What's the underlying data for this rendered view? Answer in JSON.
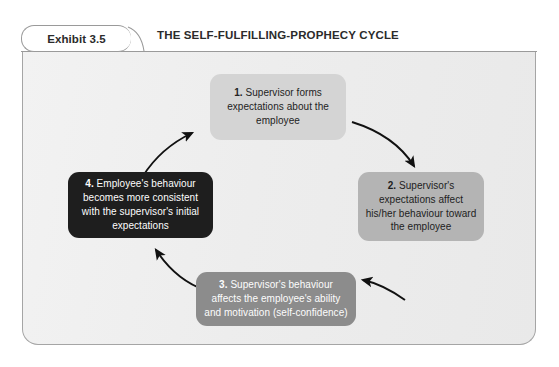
{
  "exhibit": {
    "tab_label": "Exhibit 3.5",
    "title": "THE SELF-FULFILLING-PROPHECY CYCLE"
  },
  "colors": {
    "box_1_bg": "#d4d4d4",
    "box_2_bg": "#b4b4b4",
    "box_3_bg": "#8c8c8c",
    "box_4_bg": "#1e1e1e",
    "panel_bg": "#ededed",
    "panel_border": "#a5a5a5",
    "arrow": "#111111",
    "text_dark": "#232323",
    "text_light": "#fdfdfd"
  },
  "diagram": {
    "type": "cycle",
    "step_count": 4,
    "steps": [
      {
        "number": "1.",
        "text": "Supervisor forms expectations about the employee",
        "full": "1.  Supervisor forms expectations about the employee",
        "position": "top"
      },
      {
        "number": "2.",
        "text": "Supervisor's expectations affect his/her behaviour toward the employee",
        "full": "2.  Supervisor's expectations affect his/her behaviour toward the employee",
        "position": "right"
      },
      {
        "number": "3.",
        "text": "Supervisor's behaviour affects the employee's ability and motivation (self-confidence)",
        "full": "3.  Supervisor's behaviour affects the employee's ability and motivation (self-confidence)",
        "position": "bottom"
      },
      {
        "number": "4.",
        "text": "Employee's behaviour becomes more consistent with the supervisor's initial expectations",
        "full": "4.  Employee's behaviour becomes more consistent with the supervisor's initial expectations",
        "position": "left"
      }
    ],
    "arrows": [
      {
        "name": "arrow-1-to-2",
        "from": "1",
        "to": "2",
        "direction": "clockwise"
      },
      {
        "name": "arrow-2-to-3",
        "from": "2",
        "to": "3",
        "direction": "clockwise"
      },
      {
        "name": "arrow-3-to-4",
        "from": "3",
        "to": "4",
        "direction": "clockwise"
      },
      {
        "name": "arrow-4-to-1",
        "from": "4",
        "to": "1",
        "direction": "clockwise"
      }
    ]
  }
}
